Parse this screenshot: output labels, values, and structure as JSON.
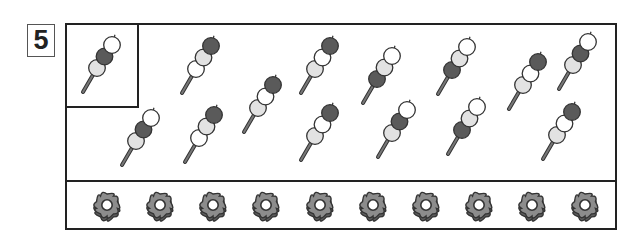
{
  "problem": {
    "number": "5"
  },
  "colors": {
    "white": "#ffffff",
    "dark": "#5a5a5a",
    "light": "#e2e2e2",
    "outline": "#333333",
    "stick": "#777777",
    "flower_fill": "#8c8c8c",
    "flower_shadow": "#5e5e5e"
  },
  "reference_skewer": {
    "x": 112,
    "y": 45,
    "balls": [
      "white",
      "dark",
      "light"
    ]
  },
  "skewers": [
    {
      "x": 211,
      "y": 46,
      "balls": [
        "dark",
        "light",
        "white"
      ]
    },
    {
      "x": 330,
      "y": 46,
      "balls": [
        "dark",
        "white",
        "light"
      ]
    },
    {
      "x": 392,
      "y": 56,
      "balls": [
        "white",
        "light",
        "dark"
      ]
    },
    {
      "x": 467,
      "y": 47,
      "balls": [
        "white",
        "light",
        "dark"
      ]
    },
    {
      "x": 538,
      "y": 62,
      "balls": [
        "dark",
        "white",
        "light"
      ]
    },
    {
      "x": 588,
      "y": 42,
      "balls": [
        "white",
        "dark",
        "light"
      ]
    },
    {
      "x": 151,
      "y": 118,
      "balls": [
        "white",
        "dark",
        "light"
      ]
    },
    {
      "x": 214,
      "y": 115,
      "balls": [
        "dark",
        "light",
        "white"
      ]
    },
    {
      "x": 273,
      "y": 85,
      "balls": [
        "dark",
        "white",
        "light"
      ]
    },
    {
      "x": 330,
      "y": 113,
      "balls": [
        "dark",
        "white",
        "light"
      ]
    },
    {
      "x": 407,
      "y": 110,
      "balls": [
        "white",
        "dark",
        "light"
      ]
    },
    {
      "x": 477,
      "y": 107,
      "balls": [
        "white",
        "light",
        "dark"
      ]
    },
    {
      "x": 572,
      "y": 112,
      "balls": [
        "dark",
        "white",
        "light"
      ]
    }
  ],
  "flowers": {
    "count": 10,
    "y": 205,
    "x": [
      107,
      160,
      213,
      266,
      320,
      373,
      426,
      479,
      532,
      585
    ]
  }
}
